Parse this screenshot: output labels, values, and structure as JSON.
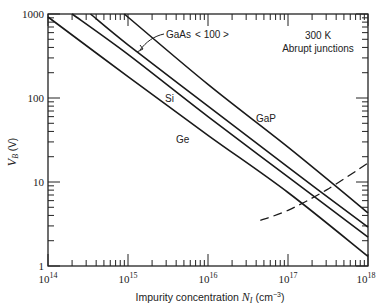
{
  "chart_data": {
    "type": "line",
    "title": "",
    "xlabel": "Impurity concentration N_I (cm^-3)",
    "ylabel": "V_B (V)",
    "xscale": "log",
    "yscale": "log",
    "xlim": [
      100000000000000.0,
      1e+18
    ],
    "ylim": [
      1,
      1000
    ],
    "grid": false,
    "x_tick_labels": [
      "10^14",
      "10^15",
      "10^16",
      "10^17",
      "10^18"
    ],
    "y_tick_labels": [
      "1",
      "10",
      "100",
      "1000"
    ],
    "annotations": [
      "300 K",
      "Abrupt junctions",
      "GaAs <100>"
    ],
    "series": [
      {
        "name": "Ge",
        "style": "solid",
        "x": [
          100000000000000.0,
          1000000000000000.0,
          1e+16,
          1e+17,
          1e+18
        ],
        "y": [
          920,
          180,
          36,
          7.5,
          1.3
        ]
      },
      {
        "name": "Si",
        "style": "solid",
        "x": [
          200000000000000.0,
          1000000000000000.0,
          1e+16,
          1e+17,
          1e+18
        ],
        "y": [
          1000,
          330,
          60,
          11.5,
          2.2
        ]
      },
      {
        "name": "GaAs <100>",
        "style": "solid",
        "x": [
          340000000000000.0,
          1000000000000000.0,
          1e+16,
          1e+17,
          1e+18
        ],
        "y": [
          1000,
          430,
          80,
          15,
          2.9
        ]
      },
      {
        "name": "GaP",
        "style": "solid",
        "x": [
          900000000000000.0,
          1e+16,
          1e+17,
          1e+18
        ],
        "y": [
          1000,
          145,
          26,
          4.3
        ]
      },
      {
        "name": "tunneling limit",
        "style": "dashed",
        "x": [
          4.5e+16,
          1e+17,
          3e+17,
          1e+18
        ],
        "y": [
          3.5,
          4.6,
          8,
          16.8
        ]
      }
    ]
  },
  "labels": {
    "temp": "300 K",
    "junction": "Abrupt junctions",
    "gaas": "GaAs",
    "gaas_orient": "< 100 >",
    "si": "Si",
    "ge": "Ge",
    "gap": "GaP",
    "xlabel_prefix": "Impurity concentration ",
    "xlabel_var": "N",
    "xlabel_sub": "I",
    "xlabel_unit": " (cm",
    "xlabel_exp": "−3",
    "xlabel_close": ")",
    "ylabel_var": "V",
    "ylabel_sub": "B",
    "ylabel_unit": " (V)",
    "y_ticks": [
      "1000",
      "100",
      "10",
      "1"
    ],
    "x_base": "10",
    "x_exps": [
      "14",
      "15",
      "16",
      "17",
      "18"
    ]
  }
}
